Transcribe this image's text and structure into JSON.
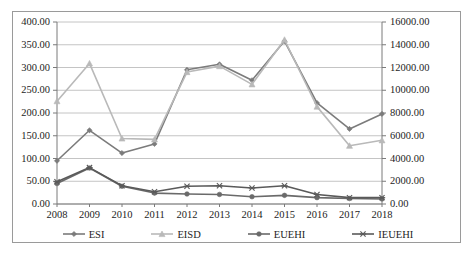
{
  "chart_data": {
    "type": "line",
    "title": "",
    "xlabel": "",
    "ylabel": "",
    "y2label": "",
    "grid": true,
    "legend_position": "bottom",
    "categories": [
      "2008",
      "2009",
      "2010",
      "2011",
      "2012",
      "2013",
      "2014",
      "2015",
      "2016",
      "2017",
      "2018"
    ],
    "ylim": [
      0,
      400
    ],
    "y2lim": [
      0,
      16000
    ],
    "y_ticks": [
      "0.00",
      "50.00",
      "100.00",
      "150.00",
      "200.00",
      "250.00",
      "300.00",
      "350.00",
      "400.00"
    ],
    "y2_ticks": [
      "0.00",
      "2000.00",
      "4000.00",
      "6000.00",
      "8000.00",
      "10000.00",
      "12000.00",
      "14000.00",
      "16000.00"
    ],
    "series": [
      {
        "name": "ESI",
        "axis": "left",
        "color": "#7b7b7b",
        "marker": "diamond",
        "values": [
          95,
          162,
          112,
          132,
          295,
          307,
          272,
          358,
          222,
          165,
          198
        ]
      },
      {
        "name": "EISD",
        "axis": "left",
        "color": "#b9b9b9",
        "marker": "triangle",
        "values": [
          226,
          309,
          144,
          142,
          290,
          303,
          263,
          361,
          214,
          128,
          140
        ]
      },
      {
        "name": "EUEHI",
        "axis": "left",
        "color": "#6a6a6a",
        "marker": "circle",
        "values": [
          45,
          79,
          39,
          24,
          22,
          21,
          16,
          19,
          14,
          12,
          11
        ]
      },
      {
        "name": "IEUEHI",
        "axis": "left",
        "color": "#5a5a5a",
        "marker": "cross",
        "values": [
          49,
          80,
          40,
          27,
          39,
          40,
          35,
          40,
          21,
          14,
          14
        ]
      }
    ]
  },
  "legend": {
    "items": [
      {
        "label": "ESI",
        "marker": "diamond-marker"
      },
      {
        "label": "EISD",
        "marker": "triangle-marker"
      },
      {
        "label": "EUEHI",
        "marker": "circle-marker"
      },
      {
        "label": "IEUEHI",
        "marker": "cross-marker"
      }
    ]
  }
}
